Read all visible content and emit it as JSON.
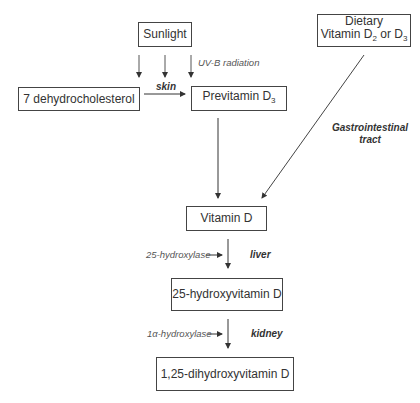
{
  "diagram": {
    "nodes": {
      "sunlight": "Sunlight",
      "dehydrocholesterol": "7 dehydrocholesterol",
      "previtamin_main": "Previtamin D",
      "previtamin_sub": "3",
      "dietary_line1": "Dietary",
      "dietary_line2a": "Vitamin D",
      "dietary_sub1": "2",
      "dietary_or": " or D",
      "dietary_sub2": "3",
      "vitamin_d": "Vitamin D",
      "hydroxy25": "25-hydroxyvitamin D",
      "dihydroxy": "1,25-dihydroxyvitamin D"
    },
    "labels": {
      "uvb": "UV-B radiation",
      "skin": "skin",
      "gi_line1": "Gastrointestinal",
      "gi_line2": "tract",
      "enzyme1": "25-hydroxylase",
      "liver": "liver",
      "enzyme2": "1α-hydroxylase",
      "kidney": "kidney"
    },
    "colors": {
      "line": "#333333",
      "text": "#333333",
      "background": "#ffffff"
    }
  }
}
